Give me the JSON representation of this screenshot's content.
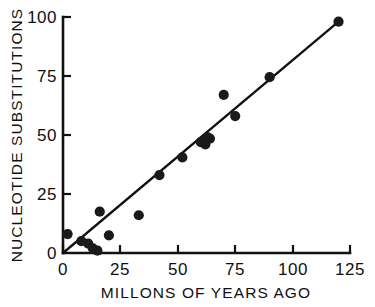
{
  "chart_data": {
    "type": "scatter",
    "title": "",
    "xlabel": "MILLONS OF YEARS AGO",
    "ylabel": "NUCLEOTIDE SUBSTITUTIONS",
    "xlim": [
      0,
      125
    ],
    "ylim": [
      0,
      100
    ],
    "xticks": [
      0,
      25,
      50,
      75,
      100,
      125
    ],
    "yticks": [
      0,
      25,
      50,
      75,
      100
    ],
    "xtick_labels": [
      "0",
      "25",
      "50",
      "75",
      "100",
      "125"
    ],
    "ytick_labels": [
      "0",
      "25",
      "50",
      "75",
      "100"
    ],
    "grid": false,
    "legend": null,
    "points": [
      {
        "x": 2,
        "y": 8
      },
      {
        "x": 8,
        "y": 5
      },
      {
        "x": 11,
        "y": 4
      },
      {
        "x": 13,
        "y": 2
      },
      {
        "x": 15,
        "y": 1
      },
      {
        "x": 16,
        "y": 17.5
      },
      {
        "x": 20,
        "y": 7.5
      },
      {
        "x": 33,
        "y": 16
      },
      {
        "x": 42,
        "y": 33
      },
      {
        "x": 52,
        "y": 40.5
      },
      {
        "x": 60,
        "y": 47
      },
      {
        "x": 62,
        "y": 46
      },
      {
        "x": 63,
        "y": 49
      },
      {
        "x": 64,
        "y": 48.5
      },
      {
        "x": 70,
        "y": 67
      },
      {
        "x": 75,
        "y": 58
      },
      {
        "x": 90,
        "y": 74.5
      },
      {
        "x": 120,
        "y": 98
      }
    ],
    "fit_line": {
      "x_start": 0,
      "y_start": 0,
      "x_end": 120,
      "y_end": 98,
      "slope": 0.8167,
      "intercept": 0
    }
  }
}
